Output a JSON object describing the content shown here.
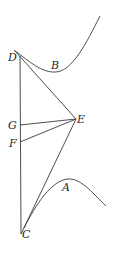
{
  "diagram": {
    "type": "geometric-figure",
    "colors": {
      "stroke": "#3a3a3a",
      "label": "#2a2a2a",
      "background": "#ffffff"
    },
    "points": {
      "D": {
        "label": "D",
        "x": 20,
        "y": 56
      },
      "G": {
        "label": "G",
        "x": 20,
        "y": 125
      },
      "F": {
        "label": "F",
        "x": 20,
        "y": 142
      },
      "C": {
        "label": "C",
        "x": 21,
        "y": 234
      },
      "E": {
        "label": "E",
        "x": 76,
        "y": 119
      }
    },
    "curves": {
      "B": {
        "label": "B"
      },
      "A": {
        "label": "A"
      }
    },
    "segments": [
      "DC",
      "DE",
      "GE",
      "FE",
      "CE"
    ]
  }
}
